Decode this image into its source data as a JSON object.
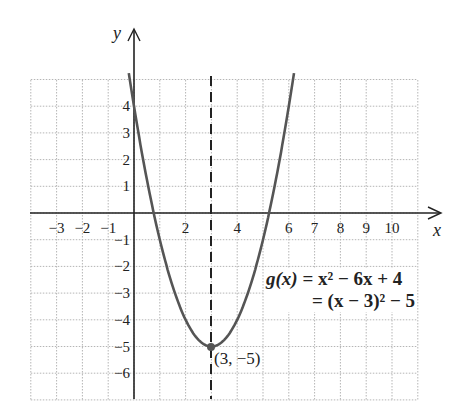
{
  "chart_data": {
    "type": "line",
    "title": "",
    "xlabel": "x",
    "ylabel": "y",
    "xlim": [
      -4,
      11
    ],
    "ylim": [
      -7,
      5
    ],
    "grid": true,
    "x_tick_labels": [
      "-3",
      "-2",
      "-1",
      "2",
      "4",
      "6",
      "7",
      "8",
      "9",
      "10"
    ],
    "y_tick_labels": [
      "4",
      "3",
      "2",
      "1",
      "-1",
      "-2",
      "-3",
      "-4",
      "-5",
      "-6"
    ],
    "series": [
      {
        "name": "g(x) = x^2 - 6x + 4",
        "function": "x^2 - 6x + 4",
        "x": [
          -0.2,
          0,
          1,
          2,
          3,
          4,
          5,
          6,
          6.2
        ],
        "y": [
          5.24,
          4,
          -1,
          -4,
          -5,
          -4,
          -1,
          4,
          5.24
        ]
      }
    ],
    "axis_of_symmetry": {
      "x": 3,
      "style": "dashed"
    },
    "vertex": {
      "x": 3,
      "y": -5,
      "label": "(3, −5)"
    },
    "annotations": [
      "g(x) = x² − 6x + 4",
      "= (x − 3)² − 5"
    ]
  },
  "labels": {
    "x_axis": "x",
    "y_axis": "y",
    "vertex": "(3, −5)",
    "eq_line1_lhs": "g(x)",
    "eq_line1_rhs": " = x² − 6x + 4",
    "eq_line2": "= (x − 3)² − 5"
  }
}
